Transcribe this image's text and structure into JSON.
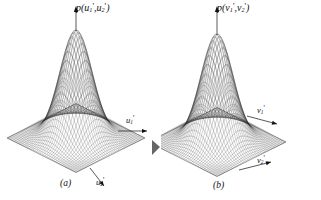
{
  "figure": {
    "background_color": "#ffffff",
    "ink_color": "#1a1a1a",
    "panels": [
      {
        "id": "a",
        "caption": "(a)",
        "vertical_axis_label": {
          "full": "p(u1',u2')",
          "func": "p(",
          "var1_base": "u",
          "var1_sub": "1",
          "var1_prime": "'",
          "sep": ",",
          "var2_base": "u",
          "var2_sub": "2",
          "var2_prime": "'",
          "close": ")"
        },
        "axis1_label": {
          "base": "u",
          "sub": "1",
          "prime": "'"
        },
        "axis2_label": {
          "base": "u",
          "sub": "2",
          "prime": "'"
        }
      },
      {
        "id": "b",
        "caption": "(b)",
        "vertical_axis_label": {
          "full": "p(v1',v2')",
          "func": "p(",
          "var1_base": "v",
          "var1_sub": "1",
          "var1_prime": "'",
          "sep": ",",
          "var2_base": "v",
          "var2_sub": "2",
          "var2_prime": "'",
          "close": ")"
        },
        "axis1_label": {
          "base": "v",
          "sub": "1",
          "prime": "'"
        },
        "axis2_label": {
          "base": "v",
          "sub": "2",
          "prime": "'"
        }
      }
    ]
  },
  "chart_data": [
    {
      "type": "surface",
      "panel": "a",
      "title": "p(u1',u2')",
      "description": "Bivariate Gaussian probability density surface rendered as a fine wireframe mesh over a square base plane, viewed in oblique 3D projection.",
      "xlabel": "u1'",
      "ylabel": "u2'",
      "zlabel": "p(u1',u2')",
      "function": "exp(-(x^2+y^2)/2)",
      "peak_value": 1.0,
      "peak_x": 0,
      "peak_y": 0,
      "sigma_x": 1.0,
      "sigma_y": 1.0,
      "correlation": 0.0,
      "xlim": [
        -3,
        3
      ],
      "ylim": [
        -3,
        3
      ],
      "zlim": [
        0,
        1
      ],
      "grid": true,
      "mesh_lines_x": 40,
      "mesh_lines_y": 40,
      "legend": "none"
    },
    {
      "type": "surface",
      "panel": "b",
      "title": "p(v1',v2')",
      "description": "Bivariate Gaussian probability density surface rendered as a fine wireframe mesh over a square base plane, viewed in oblique 3D projection.",
      "xlabel": "v1'",
      "ylabel": "v2'",
      "zlabel": "p(v1',v2')",
      "function": "exp(-(x^2+y^2)/2)",
      "peak_value": 1.0,
      "peak_x": 0,
      "peak_y": 0,
      "sigma_x": 1.0,
      "sigma_y": 1.0,
      "correlation": 0.0,
      "xlim": [
        -3,
        3
      ],
      "ylim": [
        -3,
        3
      ],
      "zlim": [
        0,
        1
      ],
      "grid": true,
      "mesh_lines_x": 40,
      "mesh_lines_y": 40,
      "legend": "none"
    }
  ]
}
